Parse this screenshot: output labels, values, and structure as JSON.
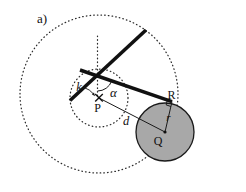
{
  "figure": {
    "panel_label": "a)",
    "points": {
      "pivot": "P",
      "disk_center": "Q",
      "contact_point": "R"
    },
    "measures": {
      "inner_radius": "k",
      "angle": "α",
      "center_distance": "d",
      "disk_radius": "r"
    },
    "colors": {
      "disk_fill": "#a8a8a8",
      "stroke": "#1a1a1a",
      "background": "#ffffff"
    }
  }
}
